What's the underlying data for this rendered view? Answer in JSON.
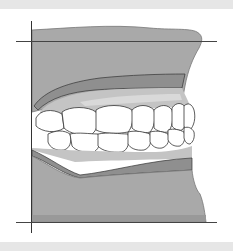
{
  "figure": {
    "type": "dental-occlusion-lateral-view",
    "elements": [
      "maxilla",
      "mandible",
      "upper-gingiva",
      "lower-gingiva",
      "upper-teeth",
      "lower-teeth",
      "horizontal-reference-line-upper",
      "horizontal-reference-line-lower",
      "vertical-reference-line"
    ]
  },
  "colors": {
    "background": "#ffffff",
    "frame_band": "#e6e6e6",
    "bone": "#a9a9a9",
    "gingiva_dark": "#8f8f8f",
    "gingiva_light": "#c4c4c4",
    "tooth": "#ffffff",
    "outline": "#333333"
  }
}
